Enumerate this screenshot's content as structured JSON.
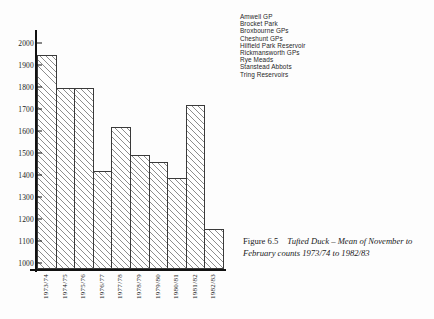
{
  "chart_data": {
    "type": "bar",
    "title": "Tufted Duck – Mean of November to February counts 1973/74 to 1982/83",
    "xlabel": "",
    "ylabel": "",
    "ylim": [
      950,
      2050
    ],
    "grid": false,
    "categories": [
      "1973/74",
      "1974/75",
      "1975/76",
      "1976/77",
      "1977/78",
      "1978/79",
      "1979/80",
      "1980/81",
      "1981/82",
      "1982/83"
    ],
    "values": [
      1945,
      1795,
      1795,
      1420,
      1620,
      1490,
      1460,
      1385,
      1720,
      1155
    ],
    "yticks": [
      1000,
      1100,
      1200,
      1300,
      1400,
      1500,
      1600,
      1700,
      1800,
      1900,
      2000
    ],
    "ytick_labels": [
      "1000",
      "1100",
      "1200",
      "1300",
      "1400",
      "1500",
      "1600",
      "1700",
      "1800",
      "1900",
      "2000"
    ],
    "legend_position": "top-right",
    "legend": [
      "Amwell GP",
      "Brocket Park",
      "Broxbourne GPs",
      "Cheshunt GPs",
      "Hilfield Park Reservoir",
      "Rickmansworth GPs",
      "Rye Meads",
      "Stanstead Abbots",
      "Tring Reservoirs"
    ],
    "bar_fill": "#ffffff",
    "bar_hatch": "/",
    "bar_edge_color": "#3a3a3a"
  },
  "caption": {
    "figure_number": "Figure 6.5",
    "text": "Tufted Duck – Mean of November to February counts 1973/74 to 1982/83"
  }
}
